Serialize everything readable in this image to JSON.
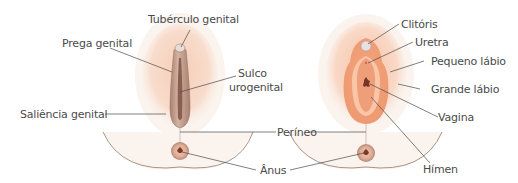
{
  "diagram": {
    "type": "anatomical-illustration",
    "panels": [
      {
        "id": "undifferentiated",
        "labels": {
          "tuberculo": "Tubérculo genital",
          "prega": "Prega genital",
          "sulco": "Sulco",
          "sulco2": "urogenital",
          "saliencia": "Saliência genital"
        }
      },
      {
        "id": "female",
        "labels": {
          "clitoris": "Clitóris",
          "uretra": "Uretra",
          "pequeno": "Pequeno lábio",
          "grande": "Grande lábio",
          "vagina": "Vagina",
          "himen": "Hímen"
        }
      }
    ],
    "shared_labels": {
      "perineo": "Períneo",
      "anus": "Ânus"
    },
    "colors": {
      "skin_outer": "#f6dcc8",
      "skin_glow": "#f3cdb6",
      "fold_male": "#b89080",
      "groove": "#8a5e50",
      "labia_orange": "#f0a27a",
      "labia_inner": "#f7c6a6",
      "vestibule": "#eea080",
      "anus_ring": "#c99a88",
      "leader_line": "#4a4a4a",
      "body_outline": "#a89484"
    }
  }
}
